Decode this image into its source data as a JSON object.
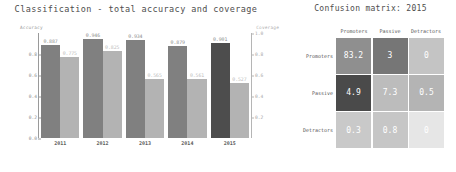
{
  "bar_chart": {
    "title": "Classification - total accuracy and coverage",
    "left_axis_label": "Accuracy",
    "right_axis_label": "Coverage",
    "left_ticks": [
      "0.0",
      "0.2",
      "0.4",
      "0.6",
      "0.8"
    ],
    "right_ticks": [
      "0.2",
      "0.4",
      "0.6",
      "0.8",
      "1.0"
    ],
    "categories": [
      "2011",
      "2012",
      "2013",
      "2014",
      "2015"
    ],
    "accuracy_values": [
      "0.887",
      "0.946",
      "0.934",
      "0.879",
      "0.901"
    ],
    "coverage_values": [
      "0.775",
      "0.825",
      "0.565",
      "0.561",
      "0.527"
    ],
    "accuracy_color": "#808080",
    "accuracy_color_highlight": "#4d4d4d",
    "coverage_color": "#b3b3b3"
  },
  "confusion_matrix": {
    "title": "Confusion matrix: 2015",
    "col_headers": [
      "Promoters",
      "Passive",
      "Detractors"
    ],
    "row_headers": [
      "Promoters",
      "Passive",
      "Detractors"
    ],
    "rows": [
      [
        "83.2",
        "3",
        "0"
      ],
      [
        "4.9",
        "7.3",
        "0.5"
      ],
      [
        "0.3",
        "0.8",
        "0"
      ]
    ],
    "cell_colors": [
      [
        "#8f8f8f",
        "#767676",
        "#c4c4c4"
      ],
      [
        "#4a4a4a",
        "#bcbcbc",
        "#b4b4b4"
      ],
      [
        "#c9c9c9",
        "#c6c6c6",
        "#e6e6e6"
      ]
    ]
  },
  "chart_data": [
    {
      "type": "bar",
      "title": "Classification - total accuracy and coverage",
      "xlabel": "",
      "ylabel": "Accuracy",
      "y2label": "Coverage",
      "categories": [
        "2011",
        "2012",
        "2013",
        "2014",
        "2015"
      ],
      "ylim": [
        0.0,
        1.0
      ],
      "y2lim": [
        0.0,
        1.0
      ],
      "grid": false,
      "legend": "none",
      "series": [
        {
          "name": "Accuracy",
          "values": [
            0.887,
            0.946,
            0.934,
            0.879,
            0.901
          ],
          "color": "#808080"
        },
        {
          "name": "Coverage",
          "values": [
            0.775,
            0.825,
            0.565,
            0.561,
            0.527
          ],
          "color": "#b3b3b3"
        }
      ],
      "annotations": [
        "2015 accuracy bar rendered darker (#4d4d4d) as highlight"
      ]
    },
    {
      "type": "heatmap",
      "title": "Confusion matrix: 2015",
      "xlabel": "",
      "ylabel": "",
      "x_categories": [
        "Promoters",
        "Passive",
        "Detractors"
      ],
      "y_categories": [
        "Promoters",
        "Passive",
        "Detractors"
      ],
      "values": [
        [
          83.2,
          3,
          0
        ],
        [
          4.9,
          7.3,
          0.5
        ],
        [
          0.3,
          0.8,
          0
        ]
      ],
      "grid": false,
      "legend": "none"
    }
  ]
}
